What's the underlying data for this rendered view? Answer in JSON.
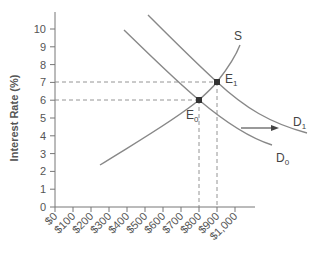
{
  "chart_data": {
    "type": "line",
    "title": "",
    "xlabel": "",
    "ylabel": "Interest Rate (%)",
    "xlim": [
      0,
      1000
    ],
    "ylim": [
      0,
      10
    ],
    "x_tick_labels": [
      "$0",
      "$100",
      "$200",
      "$300",
      "$400",
      "$500",
      "$600",
      "$700",
      "$800",
      "$900",
      "$1,000"
    ],
    "y_tick_labels": [
      "0",
      "1",
      "2",
      "3",
      "4",
      "5",
      "6",
      "7",
      "8",
      "9",
      "10"
    ],
    "grid": false,
    "series": [
      {
        "name": "S",
        "label": "S",
        "points": [
          [
            250,
            2.3
          ],
          [
            500,
            3.8
          ],
          [
            800,
            6
          ],
          [
            900,
            7
          ],
          [
            1010,
            9
          ]
        ]
      },
      {
        "name": "D0",
        "label": "D",
        "subscript": "0",
        "points": [
          [
            400,
            10
          ],
          [
            600,
            7.8
          ],
          [
            800,
            6
          ],
          [
            1000,
            4.2
          ],
          [
            1250,
            3.3
          ]
        ]
      },
      {
        "name": "D1",
        "label": "D",
        "subscript": "1",
        "points": [
          [
            540,
            10.8
          ],
          [
            700,
            9
          ],
          [
            900,
            7
          ],
          [
            1100,
            5.2
          ],
          [
            1450,
            4
          ]
        ]
      }
    ],
    "annotations": [
      {
        "label": "E",
        "subscript": "0",
        "x": 800,
        "y": 6
      },
      {
        "label": "E",
        "subscript": "1",
        "x": 900,
        "y": 7
      },
      {
        "type": "arrow",
        "description": "demand shift right",
        "from": [
          1050,
          4.6
        ],
        "to": [
          1300,
          4.6
        ]
      }
    ],
    "reference_lines": [
      {
        "type": "horizontal",
        "y": 7,
        "to_x": 900,
        "style": "dashed"
      },
      {
        "type": "horizontal",
        "y": 6,
        "to_x": 800,
        "style": "dashed"
      },
      {
        "type": "vertical",
        "x": 900,
        "to_y": 7,
        "style": "dashed"
      },
      {
        "type": "vertical",
        "x": 800,
        "to_y": 6,
        "style": "dashed"
      }
    ]
  },
  "labels": {
    "ylabel": "Interest Rate (%)",
    "s": "S",
    "e0": "E",
    "e0_sub": "0",
    "e1": "E",
    "e1_sub": "1",
    "d0": "D",
    "d0_sub": "0",
    "d1": "D",
    "d1_sub": "1"
  },
  "colors": {
    "curve": "#888888",
    "axis": "#777777",
    "text": "#555555",
    "point": "#333333"
  }
}
